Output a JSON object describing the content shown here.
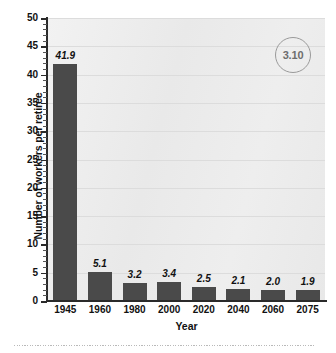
{
  "chart_data": {
    "type": "bar",
    "title": "",
    "subtitle": "",
    "xlabel": "Year",
    "ylabel": "Number of workers per retiree",
    "categories": [
      "1945",
      "1960",
      "1980",
      "2000",
      "2020",
      "2040",
      "2060",
      "2075"
    ],
    "values": [
      41.9,
      5.1,
      3.2,
      3.4,
      2.5,
      2.1,
      2.0,
      1.9
    ],
    "value_labels": [
      "41.9",
      "5.1",
      "3.2",
      "3.4",
      "2.5",
      "2.1",
      "2.0",
      "1.9"
    ],
    "ylim": [
      0,
      50
    ],
    "ytick_labels": [
      "0",
      "5",
      "10",
      "15",
      "20",
      "25",
      "30",
      "35",
      "40",
      "45",
      "50"
    ],
    "ytick_values": [
      0,
      5,
      10,
      15,
      20,
      25,
      30,
      35,
      40,
      45,
      50
    ],
    "ytick_minor_step": 1,
    "grid": true,
    "grid_axis": "y",
    "legend": "none",
    "bar_color": "#4a4a4a",
    "plot_background": "#ededed",
    "gridline_color": "#dcdcdc",
    "axis_color": "#2a2a2a"
  },
  "badge": {
    "label": "3.10",
    "border_color": "#9a9a9a",
    "text_color": "#6d6d6d"
  },
  "footer": {
    "rule_color": "#b9b9b9"
  }
}
